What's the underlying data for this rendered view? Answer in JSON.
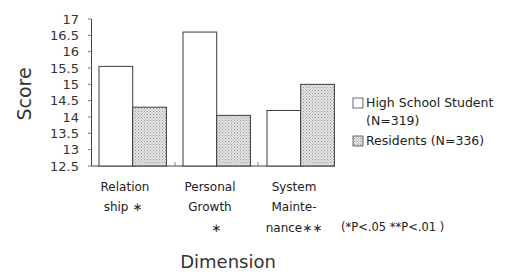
{
  "chart_data": {
    "type": "bar",
    "title": "",
    "xlabel": "Dimension",
    "ylabel": "Score",
    "ylim": [
      12.5,
      17
    ],
    "yticks": [
      12.5,
      13,
      13.5,
      14,
      14.5,
      15,
      15.5,
      16,
      16.5,
      17
    ],
    "ytick_labels": [
      "12.5",
      "13",
      "13.5",
      "14",
      "14.5",
      "15",
      "15.5",
      "16",
      "16.5",
      "17"
    ],
    "categories": [
      "Relationship *",
      "Personal Growth *",
      "System Maintenance**"
    ],
    "category_label_lines": [
      [
        "Relation",
        "ship ∗"
      ],
      [
        "Personal",
        "Growth",
        "∗"
      ],
      [
        "System",
        "Mainte-",
        "nance∗∗"
      ]
    ],
    "series": [
      {
        "name": "High School Student (N=319)",
        "values": [
          15.55,
          16.6,
          14.2
        ],
        "fill": "#ffffff",
        "pattern": "none"
      },
      {
        "name": "Residents (N=336)",
        "values": [
          14.3,
          14.05,
          15.0
        ],
        "fill": "#d4d4d4",
        "pattern": "stipple"
      }
    ],
    "legend": {
      "position": "right",
      "entries": [
        {
          "lines": [
            "High School Student",
            "(N=319)"
          ]
        },
        {
          "lines": [
            "Residents (N=336)"
          ]
        }
      ]
    },
    "annotations": [
      "(*P<.05   **P<.01 )"
    ],
    "grid": false
  }
}
